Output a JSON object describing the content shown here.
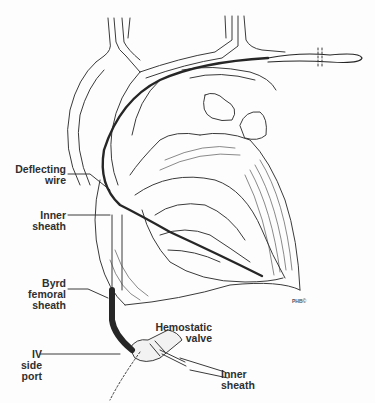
{
  "figure": {
    "labels": {
      "deflecting_wire": [
        "Deflecting",
        "wire"
      ],
      "inner_sheath_top": [
        "Inner",
        "sheath"
      ],
      "byrd_femoral_sheath": [
        "Byrd",
        "femoral",
        "sheath"
      ],
      "hemostatic_valve": [
        "Hemostatic",
        "valve"
      ],
      "iv_side_port": [
        "IV",
        "side port"
      ],
      "inner_sheath_bottom": [
        "Inner",
        "sheath"
      ]
    },
    "credit": "PHB©",
    "colors": {
      "line": "#3a3a3a",
      "wire": "#262626",
      "text": "#2f2f2f",
      "background": "#fdfdfd"
    }
  }
}
